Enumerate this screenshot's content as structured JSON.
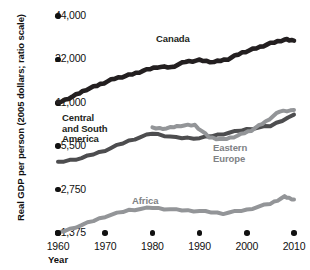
{
  "chart_data": {
    "type": "line",
    "title": "",
    "xlabel": "Year",
    "ylabel": "Real GDP per person (2005 dollars; ratio scale)",
    "scale": "ratio (log) scale",
    "grid": false,
    "legend_position": "inline-annotations",
    "xlim": [
      1960,
      2010
    ],
    "ylim": [
      1375,
      44000
    ],
    "xticks": [
      1960,
      1970,
      1980,
      1990,
      2000,
      2010
    ],
    "xtick_labels": [
      "1960",
      "1970",
      "1980",
      "1990",
      "2000",
      "2010"
    ],
    "yticks": [
      1375,
      2750,
      5500,
      11000,
      22000,
      44000
    ],
    "ytick_labels": [
      "1,375",
      "2,750",
      "5,500",
      "11,000",
      "22,000",
      "44,000"
    ],
    "series": [
      {
        "name": "Canada",
        "color": "#231f20",
        "label_color": "#231f20",
        "x": [
          1960,
          1963,
          1966,
          1969,
          1972,
          1975,
          1978,
          1981,
          1984,
          1987,
          1990,
          1993,
          1996,
          1999,
          2002,
          2005,
          2008,
          2010
        ],
        "values": [
          11000,
          12100,
          13600,
          14800,
          16200,
          17100,
          18300,
          19500,
          19400,
          21200,
          21700,
          21100,
          22100,
          24500,
          26300,
          28400,
          30200,
          29700
        ]
      },
      {
        "name": "Central and South America",
        "color": "#4d4d4f",
        "label_color": "#231f20",
        "x": [
          1960,
          1965,
          1970,
          1975,
          1980,
          1985,
          1990,
          1995,
          2000,
          2005,
          2010
        ],
        "values": [
          4250,
          4550,
          5150,
          6000,
          6750,
          6300,
          6250,
          6700,
          7200,
          7600,
          9100
        ]
      },
      {
        "name": "Eastern Europe",
        "color": "#939598",
        "label_color": "#808285",
        "x": [
          1980,
          1983,
          1986,
          1989,
          1992,
          1995,
          1998,
          2001,
          2004,
          2007,
          2010
        ],
        "values": [
          7350,
          7300,
          7650,
          7700,
          6350,
          6100,
          6500,
          7100,
          8150,
          9600,
          9800
        ]
      },
      {
        "name": "Africa",
        "color": "#939598",
        "label_color": "#808285",
        "x": [
          1960,
          1965,
          1970,
          1975,
          1980,
          1985,
          1990,
          1995,
          2000,
          2005,
          2008,
          2010
        ],
        "values": [
          1375,
          1560,
          1790,
          1980,
          2060,
          1990,
          1950,
          1880,
          1990,
          2200,
          2450,
          2350
        ]
      }
    ],
    "annotations": [
      {
        "text": "Canada",
        "series": "Canada"
      },
      {
        "text": "Central\nand South\nAmerica",
        "series": "Central and South America"
      },
      {
        "text": "Eastern\nEurope",
        "series": "Eastern Europe"
      },
      {
        "text": "Africa",
        "series": "Africa"
      }
    ]
  }
}
